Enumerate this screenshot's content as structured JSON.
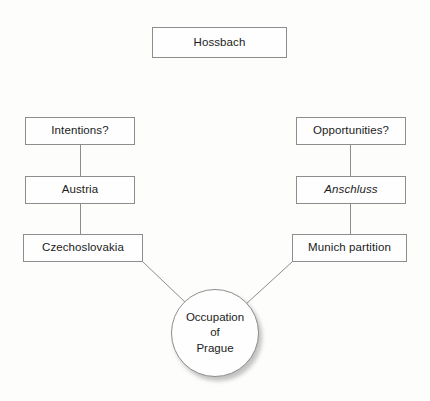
{
  "diagram": {
    "title": "Hossbach",
    "background_color": "#fdfdfc",
    "line_color": "#8d8d8d",
    "text_color": "#1b1b1b",
    "nodes": {
      "hossbach": {
        "label": "Hossbach",
        "shape": "rectangle"
      },
      "intentions": {
        "label": "Intentions?",
        "shape": "rectangle"
      },
      "austria": {
        "label": "Austria",
        "shape": "rectangle"
      },
      "czechoslovakia": {
        "label": "Czechoslovakia",
        "shape": "rectangle"
      },
      "opportunities": {
        "label": "Opportunities?",
        "shape": "rectangle"
      },
      "anschluss": {
        "label": "Anschluss",
        "shape": "rectangle",
        "style": "italic"
      },
      "munich_partition": {
        "label": "Munich partition",
        "shape": "rectangle"
      },
      "occupation": {
        "shape": "ellipse",
        "line1": "Occupation",
        "line2": "of",
        "line3": "Prague"
      }
    },
    "edges": [
      {
        "from": "intentions",
        "to": "austria",
        "type": "vertical"
      },
      {
        "from": "austria",
        "to": "czechoslovakia",
        "type": "vertical"
      },
      {
        "from": "opportunities",
        "to": "anschluss",
        "type": "vertical"
      },
      {
        "from": "anschluss",
        "to": "munich_partition",
        "type": "vertical"
      },
      {
        "from": "czechoslovakia",
        "to": "occupation",
        "type": "diagonal"
      },
      {
        "from": "munich_partition",
        "to": "occupation",
        "type": "diagonal"
      }
    ]
  }
}
